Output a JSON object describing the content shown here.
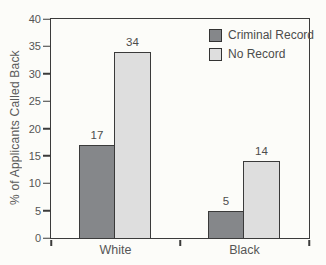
{
  "figure": {
    "background": "#fcfcf9"
  },
  "chart_data": {
    "type": "bar",
    "categories": [
      "White",
      "Black"
    ],
    "series": [
      {
        "name": "Criminal Record",
        "values": [
          17,
          5
        ],
        "color": "#85878a"
      },
      {
        "name": "No Record",
        "values": [
          34,
          14
        ],
        "color": "#dedede"
      }
    ],
    "bar_value_labels": {
      "White": {
        "Criminal Record": 17,
        "No Record": 34
      },
      "Black": {
        "Criminal Record": 5,
        "No Record": 14
      }
    },
    "title": "",
    "xlabel": "",
    "ylabel": "% of Applicants Called Back",
    "ylim": [
      0,
      40
    ],
    "yticks": [
      0,
      5,
      10,
      15,
      20,
      25,
      30,
      35,
      40
    ],
    "grid": false,
    "legend_position": "top-right-inside",
    "bar_border_color": "#3a3a3a",
    "axis_color": "#3b3b3b",
    "text_color": "#555555"
  }
}
